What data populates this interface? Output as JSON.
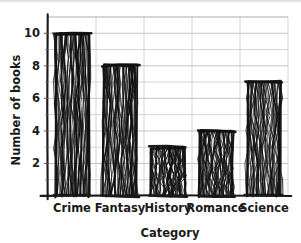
{
  "chart_data": {
    "type": "bar",
    "title": "",
    "subtitle": "",
    "xlabel": "Category",
    "ylabel": "Number of books",
    "categories": [
      "Crime",
      "Fantasy",
      "History",
      "Romance",
      "Science"
    ],
    "values": [
      10,
      8,
      3,
      4,
      7
    ],
    "ylim": [
      0,
      11
    ],
    "xlim": [
      0,
      5
    ],
    "ytick_labels": [
      "2",
      "4",
      "6",
      "8",
      "10"
    ],
    "ytick_values": [
      2,
      4,
      6,
      8,
      10
    ],
    "yminor_tick_values": [
      1,
      3,
      5,
      7,
      9
    ],
    "grid": true,
    "grid_axis": "both",
    "legend": null,
    "legend_position": "none",
    "style": "xkcd-handdrawn",
    "bar_color": "#111111",
    "grid_color": "#c9c9c9",
    "axis_color": "#1a1a1a",
    "background_color": "#ffffff",
    "annotations": []
  },
  "axes": {
    "y_title": "Number of books",
    "x_title": "Category"
  },
  "ticks": {
    "y": [
      {
        "label": "10",
        "value": 10
      },
      {
        "label": "8",
        "value": 8
      },
      {
        "label": "6",
        "value": 6
      },
      {
        "label": "4",
        "value": 4
      },
      {
        "label": "2",
        "value": 2
      }
    ],
    "x": [
      {
        "label": "Crime",
        "value": 10
      },
      {
        "label": "Fantasy",
        "value": 8
      },
      {
        "label": "History",
        "value": 3
      },
      {
        "label": "Romance",
        "value": 4
      },
      {
        "label": "Science",
        "value": 7
      }
    ]
  }
}
